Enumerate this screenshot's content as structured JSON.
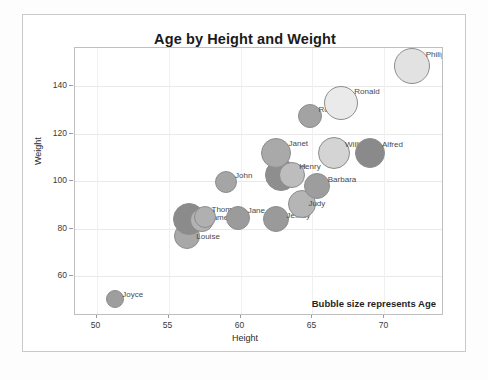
{
  "chart_data": {
    "type": "scatter",
    "title": "Age by Height and Weight",
    "xlabel": "Height",
    "ylabel": "Weight",
    "xlim": [
      48.5,
      74.0
    ],
    "ylim": [
      44.0,
      156.0
    ],
    "xticks": [
      50,
      55,
      60,
      65,
      70
    ],
    "yticks": [
      60,
      80,
      100,
      120,
      140
    ],
    "grid": true,
    "legend": "none",
    "annotation": "Bubble size represents Age",
    "size_encodes": "Age",
    "points": [
      {
        "label": "Joyce",
        "x": 51.3,
        "y": 50.5,
        "size": 9,
        "color": "#9e9e9e",
        "lx": 7,
        "ly": -9
      },
      {
        "label": "Louise",
        "x": 56.3,
        "y": 77.0,
        "size": 13,
        "color": "#a8a8a8",
        "lx": 9,
        "ly": -4
      },
      {
        "label": "Alice",
        "x": 56.4,
        "y": 84.0,
        "size": 16,
        "color": "#8b8b8b",
        "lx": 9,
        "ly": -12
      },
      {
        "label": "James",
        "x": 57.3,
        "y": 83.5,
        "size": 12,
        "color": "#b3b3b3",
        "lx": 7,
        "ly": -7
      },
      {
        "label": "Thomas",
        "x": 57.5,
        "y": 85.0,
        "size": 11,
        "color": "#b0b0b0",
        "lx": 7,
        "ly": -12
      },
      {
        "label": "Jane",
        "x": 59.8,
        "y": 84.5,
        "size": 12,
        "color": "#9b9b9b",
        "lx": 10,
        "ly": -12
      },
      {
        "label": "John",
        "x": 59.0,
        "y": 99.5,
        "size": 11,
        "color": "#a5a5a5",
        "lx": 9,
        "ly": -11
      },
      {
        "label": "Jeffrey",
        "x": 62.5,
        "y": 84.0,
        "size": 13,
        "color": "#9a9a9a",
        "lx": 10,
        "ly": -8
      },
      {
        "label": "Judy",
        "x": 64.3,
        "y": 90.5,
        "size": 14,
        "color": "#b5b5b5",
        "lx": 6,
        "ly": -5
      },
      {
        "label": "Barbara",
        "x": 65.3,
        "y": 98.0,
        "size": 13,
        "color": "#9d9d9d",
        "lx": 11,
        "ly": -11
      },
      {
        "label": "Carl",
        "x": 62.8,
        "y": 102.5,
        "size": 16,
        "color": "#8e8e8e",
        "lx": 10,
        "ly": -13
      },
      {
        "label": "Henry",
        "x": 63.6,
        "y": 102.5,
        "size": 13,
        "color": "#bdbdbd",
        "lx": 7,
        "ly": -13
      },
      {
        "label": "Janet",
        "x": 62.5,
        "y": 112.0,
        "size": 15,
        "color": "#a9a9a9",
        "lx": 12,
        "ly": -14
      },
      {
        "label": "William",
        "x": 66.5,
        "y": 112.0,
        "size": 16,
        "color": "#d4d4d4",
        "lx": 11,
        "ly": -13
      },
      {
        "label": "Alfred",
        "x": 69.0,
        "y": 112.0,
        "size": 15,
        "color": "#8a8a8a",
        "lx": 12,
        "ly": -13
      },
      {
        "label": "Robert",
        "x": 64.8,
        "y": 127.5,
        "size": 12,
        "color": "#a3a3a3",
        "lx": 9,
        "ly": -11
      },
      {
        "label": "Ronald",
        "x": 67.0,
        "y": 133.0,
        "size": 17,
        "color": "#eaeaea",
        "lx": 13,
        "ly": -16
      },
      {
        "label": "Philip",
        "x": 71.9,
        "y": 148.5,
        "size": 18,
        "color": "#e2e2e2",
        "lx": 14,
        "ly": -16
      }
    ]
  }
}
